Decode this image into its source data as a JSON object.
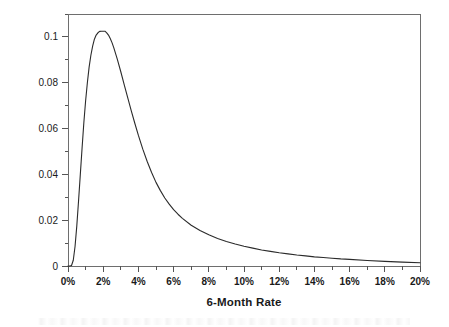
{
  "chart_data": {
    "type": "line",
    "title": "",
    "xlabel": "6-Month Rate",
    "ylabel": "Probability",
    "xlim": [
      0,
      20
    ],
    "ylim": [
      0,
      0.11
    ],
    "grid": false,
    "legend": null,
    "x_unit": "%",
    "x_ticklabels": [
      "0%",
      "2%",
      "4%",
      "6%",
      "8%",
      "10%",
      "12%",
      "14%",
      "16%",
      "18%",
      "20%"
    ],
    "x_tickvalues": [
      0,
      2,
      4,
      6,
      8,
      10,
      12,
      14,
      16,
      18,
      20
    ],
    "x_minor_step": 1,
    "y_ticklabels": [
      "0",
      "0.02",
      "0.04",
      "0.06",
      "0.08",
      "0.1"
    ],
    "y_tickvalues": [
      0,
      0.02,
      0.04,
      0.06,
      0.08,
      0.1
    ],
    "y_minor_step": 0.01,
    "series": [
      {
        "name": "probability density",
        "peak_x": 2.1,
        "peak_y": 0.1025,
        "x": [
          0.0,
          0.1,
          0.2,
          0.3,
          0.4,
          0.5,
          0.6,
          0.7,
          0.8,
          0.9,
          1.0,
          1.1,
          1.2,
          1.3,
          1.4,
          1.5,
          1.6,
          1.7,
          1.8,
          1.9,
          2.0,
          2.1,
          2.2,
          2.3,
          2.4,
          2.5,
          2.6,
          2.8,
          3.0,
          3.2,
          3.4,
          3.6,
          3.8,
          4.0,
          4.25,
          4.5,
          4.75,
          5.0,
          5.25,
          5.5,
          5.75,
          6.0,
          6.25,
          6.5,
          7.0,
          7.5,
          8.0,
          8.5,
          9.0,
          9.5,
          10.0,
          10.5,
          11.0,
          11.5,
          12.0,
          12.5,
          13.0,
          13.5,
          14.0,
          14.5,
          15.0,
          15.5,
          16.0,
          17.0,
          18.0,
          19.0,
          20.0
        ],
        "y": [
          0.0,
          0.0,
          0.0002,
          0.0025,
          0.0085,
          0.0175,
          0.0285,
          0.04,
          0.0515,
          0.0625,
          0.072,
          0.08,
          0.0868,
          0.092,
          0.096,
          0.099,
          0.1008,
          0.1018,
          0.1024,
          0.1025,
          0.1025,
          0.1025,
          0.1018,
          0.1008,
          0.0993,
          0.0975,
          0.0953,
          0.0903,
          0.0848,
          0.079,
          0.0733,
          0.0676,
          0.0622,
          0.057,
          0.051,
          0.0456,
          0.0408,
          0.0365,
          0.0329,
          0.0297,
          0.027,
          0.0246,
          0.0226,
          0.0208,
          0.0178,
          0.0155,
          0.0136,
          0.012,
          0.0107,
          0.0096,
          0.0086,
          0.0078,
          0.007,
          0.0064,
          0.0058,
          0.0053,
          0.0048,
          0.0044,
          0.004,
          0.0037,
          0.0034,
          0.0031,
          0.0029,
          0.0024,
          0.002,
          0.0017,
          0.0014
        ]
      }
    ]
  },
  "axes": {
    "x_title": "6-Month Rate",
    "y_title": "Probability"
  },
  "colors": {
    "curve": "#2b2b2b",
    "frame": "#6e6e6e",
    "text": "#1a1a1a",
    "background": "#ffffff"
  }
}
